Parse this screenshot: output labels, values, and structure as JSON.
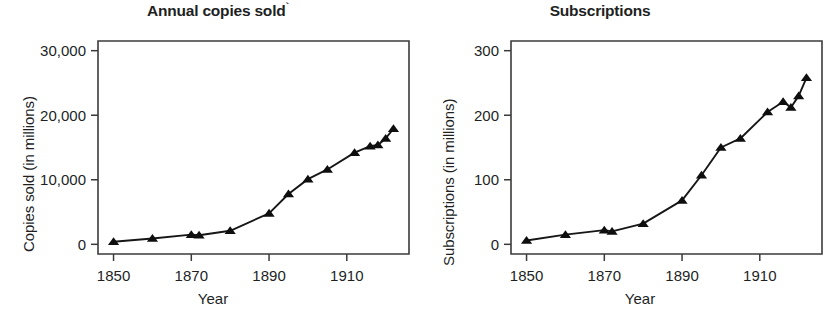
{
  "figure": {
    "background": "#ffffff",
    "ink_color": "#231f20"
  },
  "chart_data": [
    {
      "type": "line",
      "panel": "left",
      "title": "Annual copies sold",
      "title_mark": "`",
      "xlabel": "Year",
      "ylabel": "Copies sold (in millions)",
      "xlim": [
        1846,
        1926
      ],
      "ylim": [
        -1500,
        31500
      ],
      "xticks": [
        1850,
        1870,
        1890,
        1910
      ],
      "xtick_labels": [
        "1850",
        "1870",
        "1890",
        "1910"
      ],
      "yticks": [
        0,
        10000,
        20000,
        30000
      ],
      "ytick_labels": [
        "0",
        "10,000",
        "20,000",
        "30,000"
      ],
      "grid": false,
      "legend": null,
      "marker": "triangle-up",
      "series": [
        {
          "name": "Annual copies sold",
          "x": [
            1850,
            1860,
            1870,
            1872,
            1880,
            1890,
            1895,
            1900,
            1905,
            1912,
            1916,
            1918,
            1920,
            1922
          ],
          "values": [
            400,
            900,
            1500,
            1400,
            2100,
            4800,
            7800,
            10100,
            11600,
            14200,
            15200,
            15400,
            16400,
            17900
          ]
        }
      ]
    },
    {
      "type": "line",
      "panel": "right",
      "title": "Subscriptions",
      "title_mark": "",
      "xlabel": "Year",
      "ylabel": "Subscriptions (in millions)",
      "xlim": [
        1846,
        1926
      ],
      "ylim": [
        -15,
        315
      ],
      "xticks": [
        1850,
        1870,
        1890,
        1910
      ],
      "xtick_labels": [
        "1850",
        "1870",
        "1890",
        "1910"
      ],
      "yticks": [
        0,
        100,
        200,
        300
      ],
      "ytick_labels": [
        "0",
        "100",
        "200",
        "300"
      ],
      "grid": false,
      "legend": null,
      "marker": "triangle-up",
      "series": [
        {
          "name": "Subscriptions",
          "x": [
            1850,
            1860,
            1870,
            1872,
            1880,
            1890,
            1895,
            1900,
            1905,
            1912,
            1916,
            1918,
            1920,
            1922
          ],
          "values": [
            6,
            15,
            22,
            20,
            32,
            68,
            107,
            150,
            164,
            205,
            221,
            212,
            230,
            258
          ]
        }
      ]
    }
  ]
}
